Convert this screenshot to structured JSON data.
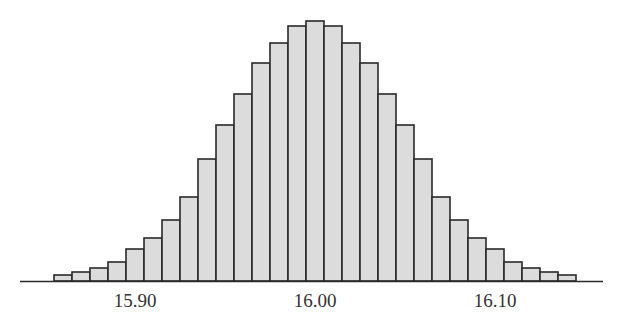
{
  "chart_data": {
    "type": "bar",
    "subtype": "histogram",
    "title": "",
    "xlabel": "",
    "ylabel": "",
    "bin_width": 0.01,
    "x_range": [
      15.855,
      16.145
    ],
    "bin_centers": [
      15.86,
      15.87,
      15.88,
      15.89,
      15.9,
      15.91,
      15.92,
      15.93,
      15.94,
      15.95,
      15.96,
      15.97,
      15.98,
      15.99,
      16.0,
      16.01,
      16.02,
      16.03,
      16.04,
      16.05,
      16.06,
      16.07,
      16.08,
      16.09,
      16.1,
      16.11,
      16.12,
      16.13,
      16.14
    ],
    "values": [
      6,
      9,
      13,
      19,
      32,
      43,
      61,
      84,
      122,
      156,
      187,
      218,
      238,
      255,
      260,
      255,
      238,
      218,
      187,
      156,
      122,
      84,
      61,
      43,
      32,
      19,
      13,
      9,
      6
    ],
    "value_units": "relative frequency (pixel height, unlabeled y-axis)",
    "x_ticks": [
      {
        "value": 15.9,
        "label": "15.90"
      },
      {
        "value": 16.0,
        "label": "16.00"
      },
      {
        "value": 16.1,
        "label": "16.10"
      }
    ],
    "y_axis_visible": false,
    "grid": false,
    "legend": null,
    "colors": {
      "bar_fill": "#dcdcdc",
      "bar_edge": "#2a2a2a",
      "axis": "#2a2a2a"
    }
  }
}
